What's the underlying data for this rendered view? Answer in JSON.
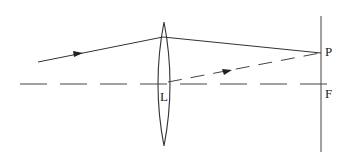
{
  "diagram": {
    "labels": {
      "lens": "L",
      "point_p": "P",
      "focal_point": "F"
    },
    "elements": [
      "converging-lens",
      "principal-axis (dashed)",
      "focal-plane (vertical line)",
      "incident-ray (solid, arrow)",
      "refracted-ray (solid) to P",
      "parallel central ray (dashed, arrow) through lens center to P"
    ],
    "colors": {
      "line": "#333333",
      "background": "#ffffff"
    }
  }
}
